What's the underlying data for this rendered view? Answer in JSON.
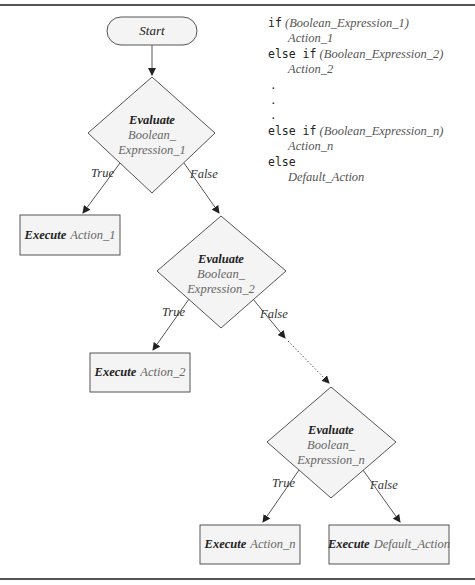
{
  "code": {
    "lines": [
      {
        "keyword": "if",
        "expr": "(Boolean_Expression_1)"
      },
      {
        "action": "Action_1"
      },
      {
        "keyword": "else if",
        "expr": "(Boolean_Expression_2)"
      },
      {
        "action": "Action_2"
      },
      {
        "dot": "."
      },
      {
        "dot": "."
      },
      {
        "dot": "."
      },
      {
        "keyword": "else if",
        "expr": "(Boolean_Expression_n)"
      },
      {
        "action": "Action_n"
      },
      {
        "keyword": "else"
      },
      {
        "action": "Default_Action"
      }
    ]
  },
  "flowchart": {
    "start": "Start",
    "decisions": [
      {
        "verb": "Evaluate",
        "line1": "Boolean_",
        "line2": "Expression_1",
        "true_label": "True",
        "false_label": "False"
      },
      {
        "verb": "Evaluate",
        "line1": "Boolean_",
        "line2": "Expression_2",
        "true_label": "True",
        "false_label": "False"
      },
      {
        "verb": "Evaluate",
        "line1": "Boolean_",
        "line2": "Expression_n",
        "true_label": "True",
        "false_label": "False"
      }
    ],
    "actions": [
      {
        "verb": "Execute",
        "name": "Action_1"
      },
      {
        "verb": "Execute",
        "name": "Action_2"
      },
      {
        "verb": "Execute",
        "name": "Action_n"
      },
      {
        "verb": "Execute",
        "name": "Default_Action"
      }
    ]
  },
  "colors": {
    "stroke": "#555555",
    "shape_fill": "#f4f4f4",
    "text": "#222222",
    "italic_var": "#666666"
  }
}
